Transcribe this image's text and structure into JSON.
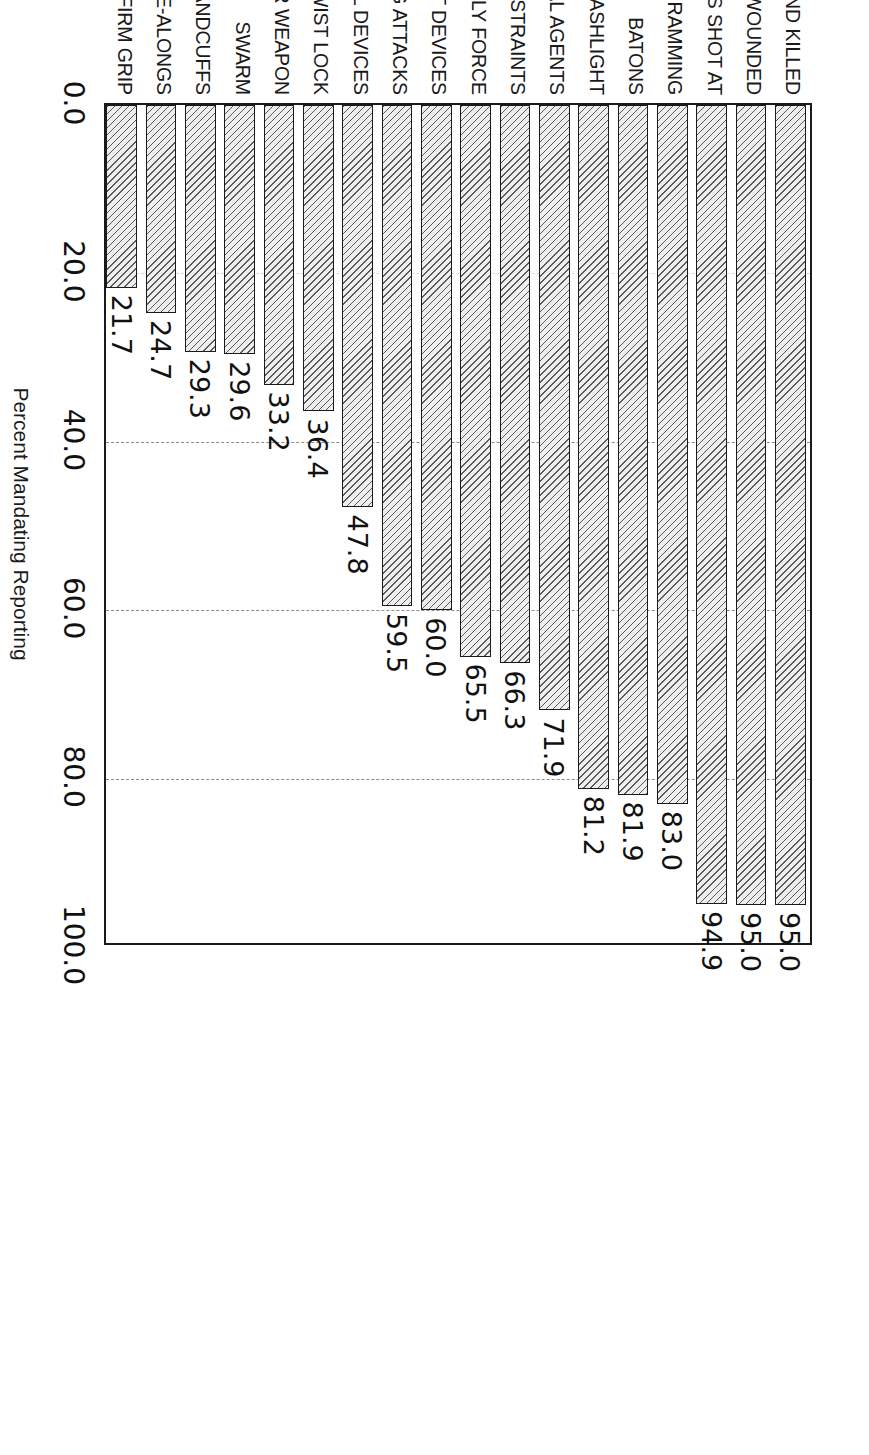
{
  "chart_data": {
    "type": "bar",
    "orientation": "horizontal",
    "title": "",
    "xlabel": "Percent Mandating Reporting",
    "ylabel": "",
    "xlim": [
      0.0,
      100.0
    ],
    "xticks": [
      "0.0",
      "20.0",
      "40.0",
      "60.0",
      "80.0",
      "100.0"
    ],
    "xtick_values": [
      0,
      20,
      40,
      60,
      80,
      100
    ],
    "grid": "dashed vertical gridlines at 20, 40, 60, 80",
    "legend": "none",
    "categories": [
      "CIVILIANS SHOT AND KILLED",
      "CIVILIANS SHOT AND WOUNDED",
      "CIVILIANS SHOT AT",
      "VEHICLE RAMMING",
      "BATONS",
      "FLASHLIGHT",
      "CHEMICAL AGENTS",
      "NECK RESTRAINTS",
      "BODILY FORCE",
      "OTHER IMPACT DEVICES",
      "DOG ATTACKS",
      "ELECTRICAL DEVICES",
      "TWIST LOCK",
      "UNHOLSTER WEAPON",
      "SWARM",
      "HANDCUFFS",
      "COME-ALONGS",
      "FIRM GRIP"
    ],
    "values": [
      95.0,
      95.0,
      94.9,
      83.0,
      81.9,
      81.2,
      71.9,
      66.3,
      65.5,
      60.0,
      59.5,
      47.8,
      36.4,
      33.2,
      29.6,
      29.3,
      24.7,
      21.7
    ],
    "value_labels": [
      "95.0",
      "95.0",
      "94.9",
      "83.0",
      "81.9",
      "81.2",
      "71.9",
      "66.3",
      "65.5",
      "60.0",
      "59.5",
      "47.8",
      "36.4",
      "33.2",
      "29.6",
      "29.3",
      "24.7",
      "21.7"
    ],
    "bar_style": {
      "fill": "#eeeeee",
      "hatch": "diagonal",
      "edge": "#1a1a1a"
    }
  }
}
